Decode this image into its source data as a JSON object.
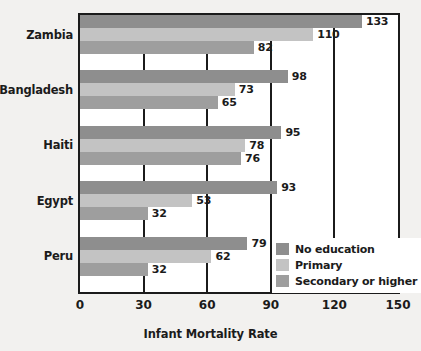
{
  "chart_data": {
    "type": "bar",
    "orientation": "horizontal",
    "title": "",
    "xlabel": "Infant Mortality Rate",
    "ylabel": "",
    "xlim": [
      0,
      150
    ],
    "xticks": [
      0,
      30,
      60,
      90,
      120,
      150
    ],
    "grid": true,
    "legend_position": "inside-right-lower",
    "categories": [
      "Zambia",
      "Bangladesh",
      "Haiti",
      "Egypt",
      "Peru"
    ],
    "series": [
      {
        "name": "No education",
        "color": "#8e8e8e",
        "values": [
          133,
          98,
          95,
          93,
          79
        ]
      },
      {
        "name": "Primary",
        "color": "#c3c3c3",
        "values": [
          110,
          73,
          78,
          53,
          62
        ]
      },
      {
        "name": "Secondary or higher",
        "color": "#9e9e9e",
        "values": [
          82,
          65,
          76,
          32,
          32
        ]
      }
    ]
  },
  "axis": {
    "tick_labels": [
      "0",
      "30",
      "60",
      "90",
      "120",
      "150"
    ],
    "x_title": "Infant Mortality Rate"
  },
  "legend": {
    "items": [
      {
        "label": "No education",
        "color": "#8e8e8e"
      },
      {
        "label": "Primary",
        "color": "#c3c3c3"
      },
      {
        "label": "Secondary or higher",
        "color": "#9e9e9e"
      }
    ]
  },
  "colors": {
    "background": "#f2f1ef",
    "plot_background": "#ffffff",
    "axis": "#1b1b1b",
    "text": "#1b1b1b"
  }
}
